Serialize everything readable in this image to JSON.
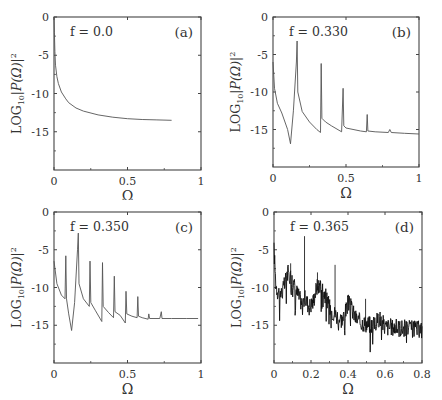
{
  "figure": {
    "ylabel": "LOG10|P(Ω)|²",
    "xlabel": "Ω"
  },
  "chart_data": [
    {
      "id": "a",
      "type": "line",
      "panel_label": "(a)",
      "annotation": "f = 0.0",
      "xlabel": "Ω",
      "ylabel": "LOG10|P(Ω)|²",
      "xlim": [
        0,
        1
      ],
      "ylim": [
        -20,
        0
      ],
      "xticks": [
        0,
        0.5,
        1
      ],
      "xtick_labels": [
        "0",
        "0.5",
        "1"
      ],
      "yticks": [
        0,
        -5,
        -10,
        -15
      ],
      "ytick_labels": [
        "0",
        "-5",
        "-10",
        "-15"
      ],
      "x": [
        0.0,
        0.003,
        0.006,
        0.01,
        0.02,
        0.03,
        0.05,
        0.08,
        0.1,
        0.15,
        0.2,
        0.3,
        0.4,
        0.5,
        0.6,
        0.7,
        0.8
      ],
      "y": [
        0,
        -2.0,
        -4.5,
        -6.3,
        -7.8,
        -8.7,
        -9.8,
        -10.7,
        -11.2,
        -11.9,
        -12.3,
        -12.8,
        -13.1,
        -13.3,
        -13.4,
        -13.45,
        -13.5
      ]
    },
    {
      "id": "b",
      "type": "line",
      "panel_label": "(b)",
      "annotation": "f = 0.330",
      "xlabel": "Ω",
      "ylabel": "LOG10|P(Ω)|²",
      "xlim": [
        0,
        1
      ],
      "ylim": [
        -20,
        0
      ],
      "xticks": [
        0,
        0.5,
        1
      ],
      "xtick_labels": [
        "0",
        "0.5",
        "1"
      ],
      "yticks": [
        0,
        -5,
        -10,
        -15
      ],
      "ytick_labels": [
        "0",
        "-5",
        "-10",
        "-15"
      ],
      "x": [
        0.0,
        0.01,
        0.03,
        0.06,
        0.1,
        0.12,
        0.14,
        0.16,
        0.165,
        0.17,
        0.2,
        0.25,
        0.3,
        0.325,
        0.33,
        0.335,
        0.36,
        0.4,
        0.47,
        0.48,
        0.485,
        0.5,
        0.6,
        0.64,
        0.645,
        0.65,
        0.7,
        0.79,
        0.8,
        0.81,
        0.9,
        1.0
      ],
      "y": [
        -6,
        -9.5,
        -11.5,
        -12.8,
        -15.0,
        -16.9,
        -12.5,
        -6.0,
        -3.2,
        -10.0,
        -12.6,
        -14.0,
        -15.0,
        -15.4,
        -6.2,
        -13.5,
        -14.0,
        -14.5,
        -15.3,
        -9.5,
        -14.5,
        -14.8,
        -15.2,
        -15.3,
        -13.0,
        -15.2,
        -15.3,
        -15.4,
        -15.0,
        -15.4,
        -15.5,
        -15.6
      ]
    },
    {
      "id": "c",
      "type": "line",
      "panel_label": "(c)",
      "annotation": "f = 0.350",
      "xlabel": "Ω",
      "ylabel": "LOG10|P(Ω)|²",
      "xlim": [
        0,
        1
      ],
      "ylim": [
        -20,
        0
      ],
      "xticks": [
        0,
        0.5,
        1
      ],
      "xtick_labels": [
        "0",
        "0.5",
        "1"
      ],
      "yticks": [
        0,
        -5,
        -10,
        -15
      ],
      "ytick_labels": [
        "0",
        "-5",
        "-10",
        "-15"
      ],
      "x": [
        0.0,
        0.02,
        0.05,
        0.075,
        0.08,
        0.085,
        0.1,
        0.12,
        0.14,
        0.16,
        0.165,
        0.17,
        0.2,
        0.24,
        0.245,
        0.25,
        0.28,
        0.325,
        0.33,
        0.335,
        0.37,
        0.405,
        0.41,
        0.415,
        0.45,
        0.485,
        0.49,
        0.495,
        0.53,
        0.565,
        0.57,
        0.575,
        0.6,
        0.64,
        0.645,
        0.65,
        0.72,
        0.73,
        0.735,
        0.8,
        0.9,
        0.98
      ],
      "y": [
        -6.5,
        -9.5,
        -11.0,
        -11.5,
        -5.8,
        -11.5,
        -13.5,
        -15.7,
        -12.0,
        -5.0,
        -2.8,
        -9.5,
        -11.5,
        -12.5,
        -6.5,
        -12.0,
        -13.0,
        -14.5,
        -6.7,
        -12.5,
        -13.3,
        -14.0,
        -8.5,
        -13.2,
        -13.7,
        -14.7,
        -10.5,
        -13.5,
        -13.8,
        -14.0,
        -11.2,
        -13.8,
        -14.0,
        -14.2,
        -13.5,
        -14.1,
        -14.1,
        -13.2,
        -14.1,
        -14.1,
        -14.1,
        -14.1
      ]
    },
    {
      "id": "d",
      "type": "line",
      "panel_label": "(d)",
      "annotation": "f = 0.365",
      "xlabel": "Ω",
      "ylabel": "LOG10|P(Ω)|²",
      "xlim": [
        0,
        0.8
      ],
      "ylim": [
        -20,
        0
      ],
      "xticks": [
        0,
        0.2,
        0.4,
        0.6,
        0.8
      ],
      "xtick_labels": [
        "0",
        "0.2",
        "0.4",
        "0.6",
        "0.8"
      ],
      "yticks": [
        0,
        -5,
        -10,
        -15
      ],
      "ytick_labels": [
        "0",
        "-5",
        "-10",
        "-15"
      ],
      "envelope_x": [
        0.0,
        0.01,
        0.02,
        0.04,
        0.06,
        0.07,
        0.09,
        0.11,
        0.13,
        0.15,
        0.17,
        0.19,
        0.21,
        0.23,
        0.25,
        0.27,
        0.29,
        0.31,
        0.33,
        0.35,
        0.37,
        0.39,
        0.4,
        0.42,
        0.44,
        0.46,
        0.5,
        0.54,
        0.57,
        0.6,
        0.65,
        0.7,
        0.75,
        0.8
      ],
      "envelope_y": [
        -5,
        -9.5,
        -10.5,
        -10.8,
        -9.5,
        -8.0,
        -8.5,
        -9.8,
        -11.0,
        -12.0,
        -11.5,
        -12.5,
        -12.0,
        -10.0,
        -9.5,
        -10.5,
        -12.0,
        -13.0,
        -13.5,
        -14.0,
        -14.3,
        -13.0,
        -12.0,
        -12.8,
        -14.0,
        -14.5,
        -14.8,
        -15.0,
        -14.0,
        -15.2,
        -15.3,
        -15.4,
        -15.5,
        -15.6
      ],
      "spikes": [
        {
          "x": 0.165,
          "y": -3.2
        },
        {
          "x": 0.33,
          "y": -7.0
        },
        {
          "x": 0.495,
          "y": -11.5
        },
        {
          "x": 0.09,
          "y": -6.8
        },
        {
          "x": 0.235,
          "y": -8.0
        }
      ],
      "noise_amplitude": 1.2
    }
  ]
}
